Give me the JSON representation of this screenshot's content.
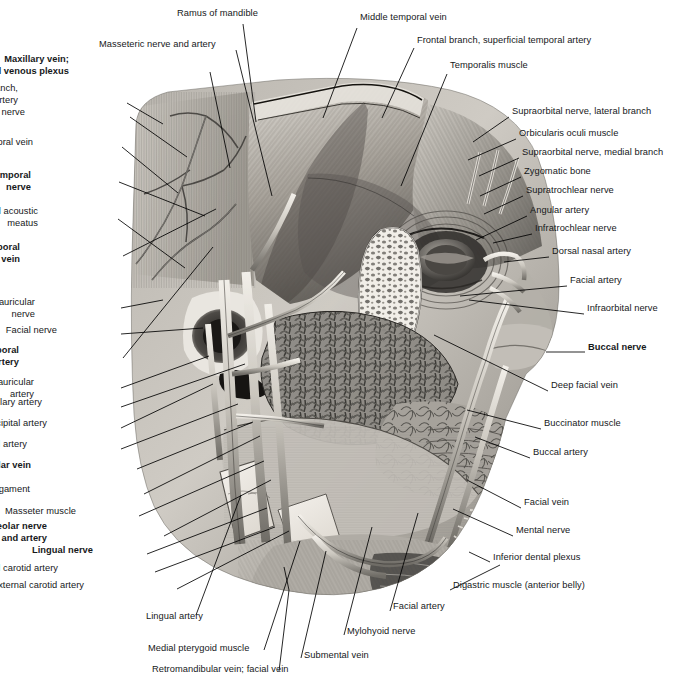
{
  "figure": {
    "kind": "anatomical-illustration",
    "style": "grayscale pencil / airbrush medical drawing",
    "palette": {
      "background": "#ffffff",
      "ink": "#16181a",
      "leader_line": "#000000",
      "tissue_light": "#d8d5d0",
      "tissue_mid": "#9a968f",
      "tissue_dark": "#4e4b47",
      "bone_light": "#efece6",
      "vessel_light": "#e8e5df",
      "shadow": "#2b2926"
    }
  },
  "labels": {
    "top": [
      {
        "id": "ramus-of-mandible",
        "text": "Ramus of mandible",
        "bold": false,
        "align": "left",
        "x": 177,
        "y": 14
      },
      {
        "id": "middle-temporal-vein-top",
        "text": "Middle temporal vein",
        "bold": false,
        "align": "left",
        "x": 360,
        "y": 18
      },
      {
        "id": "masseteric-nerve-and-artery",
        "text": "Masseteric nerve and artery",
        "bold": false,
        "align": "left",
        "x": 99,
        "y": 45
      },
      {
        "id": "frontal-branch-superficial-temporal-artery",
        "text": "Frontal branch, superficial temporal artery",
        "bold": false,
        "align": "left",
        "x": 417,
        "y": 41
      },
      {
        "id": "maxillary-vein-pterygoid-venous-plexus",
        "text": "Maxillary vein;\npterygoid venous plexus",
        "bold": true,
        "align": "right",
        "x": 69,
        "y": 60
      },
      {
        "id": "temporalis-muscle",
        "text": "Temporalis muscle",
        "bold": false,
        "align": "left",
        "x": 450,
        "y": 66
      }
    ],
    "left": [
      {
        "id": "parietal-branch-superficial-temporal-artery",
        "text": "Parietal branch,\nsuperficial temporal artery",
        "bold": false,
        "align": "right",
        "x": 18,
        "y": 89
      },
      {
        "id": "auriculotemporal-nerve-1",
        "text": "Auriculotemporal nerve",
        "bold": false,
        "align": "right",
        "x": 25,
        "y": 113
      },
      {
        "id": "middle-temporal-vein-left",
        "text": "Middle temporal vein",
        "bold": false,
        "align": "right",
        "x": 33,
        "y": 143
      },
      {
        "id": "auriculotemporal-nerve-bold",
        "text": "Auriculotemporal\nnerve",
        "bold": true,
        "align": "right",
        "x": 31,
        "y": 176
      },
      {
        "id": "external-acoustic-meatus",
        "text": "External acoustic\nmeatus",
        "bold": false,
        "align": "right",
        "x": 38,
        "y": 212
      },
      {
        "id": "superficial-temporal-vein",
        "text": "Superficial temporal\nvein",
        "bold": true,
        "align": "right",
        "x": 20,
        "y": 248
      },
      {
        "id": "posterior-auricular-nerve",
        "text": "Posterior auricular\nnerve",
        "bold": false,
        "align": "right",
        "x": 35,
        "y": 303
      },
      {
        "id": "facial-nerve",
        "text": "Facial nerve",
        "bold": false,
        "align": "right",
        "x": 57,
        "y": 331
      },
      {
        "id": "superficial-temporal-artery",
        "text": "Superficial temporal\nartery",
        "bold": true,
        "align": "right",
        "x": 19,
        "y": 351
      },
      {
        "id": "posterior-auricular-artery",
        "text": "Posterior auricular\nartery",
        "bold": false,
        "align": "right",
        "x": 34,
        "y": 383
      },
      {
        "id": "maxillary-artery",
        "text": "Maxillary artery",
        "bold": false,
        "align": "right",
        "x": 42,
        "y": 403
      },
      {
        "id": "occipital-artery",
        "text": "Occipital artery",
        "bold": false,
        "align": "right",
        "x": 47,
        "y": 424
      },
      {
        "id": "external-carotid-artery-upper",
        "text": "External carotid artery",
        "bold": false,
        "align": "right",
        "x": 27,
        "y": 445
      },
      {
        "id": "retromandibular-vein",
        "text": "Retromandibular vein",
        "bold": true,
        "align": "right",
        "x": 31,
        "y": 466
      },
      {
        "id": "sphenomandibular-ligament",
        "text": "Sphenomandibular ligament",
        "bold": false,
        "align": "right",
        "x": 30,
        "y": 490
      },
      {
        "id": "masseter-muscle",
        "text": "Masseter muscle",
        "bold": false,
        "align": "right",
        "x": 76,
        "y": 512
      },
      {
        "id": "inferior-alveolar-nerve-and-artery",
        "text": "Inferior alveolar nerve\nand artery",
        "bold": true,
        "align": "right",
        "x": 47,
        "y": 527
      },
      {
        "id": "lingual-nerve",
        "text": "Lingual nerve",
        "bold": true,
        "align": "right",
        "x": 93,
        "y": 551
      },
      {
        "id": "internal-carotid-artery",
        "text": "Internal carotid artery",
        "bold": false,
        "align": "right",
        "x": 58,
        "y": 569
      },
      {
        "id": "external-carotid-artery-lower",
        "text": "External carotid artery",
        "bold": false,
        "align": "right",
        "x": 84,
        "y": 586
      }
    ],
    "right": [
      {
        "id": "supraorbital-nerve-lateral-branch",
        "text": "Supraorbital nerve, lateral branch",
        "bold": false,
        "align": "left",
        "x": 512,
        "y": 112
      },
      {
        "id": "orbicularis-oculi-muscle",
        "text": "Orbicularis oculi muscle",
        "bold": false,
        "align": "left",
        "x": 519,
        "y": 134
      },
      {
        "id": "supraorbital-nerve-medial-branch",
        "text": "Supraorbital nerve, medial branch",
        "bold": false,
        "align": "left",
        "x": 522,
        "y": 153
      },
      {
        "id": "zygomatic-bone",
        "text": "Zygomatic bone",
        "bold": false,
        "align": "left",
        "x": 524,
        "y": 172
      },
      {
        "id": "supratrochlear-nerve",
        "text": "Supratrochlear nerve",
        "bold": false,
        "align": "left",
        "x": 526,
        "y": 191
      },
      {
        "id": "angular-artery",
        "text": "Angular artery",
        "bold": false,
        "align": "left",
        "x": 530,
        "y": 211
      },
      {
        "id": "infratrochlear-nerve",
        "text": "Infratrochlear nerve",
        "bold": false,
        "align": "left",
        "x": 535,
        "y": 229
      },
      {
        "id": "dorsal-nasal-artery",
        "text": "Dorsal nasal artery",
        "bold": false,
        "align": "left",
        "x": 552,
        "y": 252
      },
      {
        "id": "facial-artery-right",
        "text": "Facial artery",
        "bold": false,
        "align": "left",
        "x": 570,
        "y": 281
      },
      {
        "id": "infraorbital-nerve",
        "text": "Infraorbital nerve",
        "bold": false,
        "align": "left",
        "x": 587,
        "y": 309
      },
      {
        "id": "buccal-nerve",
        "text": "Buccal nerve",
        "bold": true,
        "align": "left",
        "x": 588,
        "y": 348
      },
      {
        "id": "deep-facial-vein",
        "text": "Deep facial vein",
        "bold": false,
        "align": "left",
        "x": 551,
        "y": 386
      },
      {
        "id": "buccinator-muscle",
        "text": "Buccinator muscle",
        "bold": false,
        "align": "left",
        "x": 544,
        "y": 424
      },
      {
        "id": "buccal-artery",
        "text": "Buccal artery",
        "bold": false,
        "align": "left",
        "x": 533,
        "y": 453
      },
      {
        "id": "facial-vein",
        "text": "Facial vein",
        "bold": false,
        "align": "left",
        "x": 524,
        "y": 503
      },
      {
        "id": "mental-nerve",
        "text": "Mental nerve",
        "bold": false,
        "align": "left",
        "x": 516,
        "y": 531
      },
      {
        "id": "inferior-dental-plexus",
        "text": "Inferior dental plexus",
        "bold": false,
        "align": "left",
        "x": 493,
        "y": 558
      },
      {
        "id": "digastric-muscle-anterior-belly",
        "text": "Digastric muscle (anterior belly)",
        "bold": false,
        "align": "left",
        "x": 453,
        "y": 586
      }
    ],
    "bottom": [
      {
        "id": "lingual-artery",
        "text": "Lingual artery",
        "bold": false,
        "align": "left",
        "x": 146,
        "y": 617
      },
      {
        "id": "facial-artery-bottom",
        "text": "Facial artery",
        "bold": false,
        "align": "left",
        "x": 393,
        "y": 607
      },
      {
        "id": "mylohyoid-nerve",
        "text": "Mylohyoid nerve",
        "bold": false,
        "align": "left",
        "x": 347,
        "y": 632
      },
      {
        "id": "medial-pterygoid-muscle",
        "text": "Medial pterygoid muscle",
        "bold": false,
        "align": "left",
        "x": 148,
        "y": 649
      },
      {
        "id": "submental-vein",
        "text": "Submental vein",
        "bold": false,
        "align": "left",
        "x": 304,
        "y": 656
      },
      {
        "id": "retromandibular-vein-facial-vein",
        "text": "Retromandibular vein; facial vein",
        "bold": false,
        "align": "left",
        "x": 152,
        "y": 670
      }
    ]
  },
  "leaders": [
    {
      "id": "ld-ramus-of-mandible",
      "pts": "243,24 256,122"
    },
    {
      "id": "ld-middle-temporal-vein-top",
      "pts": "357,28 323,118"
    },
    {
      "id": "ld-masseteric-nerve-and-artery",
      "pts": "236,50 272,196"
    },
    {
      "id": "ld-frontal-branch",
      "pts": "414,48 382,118"
    },
    {
      "id": "ld-maxillary-vein",
      "pts": "210,72 230,168"
    },
    {
      "id": "ld-temporalis-muscle",
      "pts": "447,74 401,186"
    },
    {
      "id": "ld-parietal-branch",
      "pts": "127,103 163,124"
    },
    {
      "id": "ld-auriculotemporal-nerve-1",
      "pts": "130,117 187,157"
    },
    {
      "id": "ld-middle-temporal-vein-left",
      "pts": "122,147 178,193"
    },
    {
      "id": "ld-auriculotemporal-nerve-bold",
      "pts": "119,182 205,216"
    },
    {
      "id": "ld-external-acoustic-meatus",
      "pts": "118,219 185,268"
    },
    {
      "id": "ld-superficial-temporal-vein",
      "pts": "123,256 216,209"
    },
    {
      "id": "ld-posterior-auricular-nerve",
      "pts": "121,308 163,300"
    },
    {
      "id": "ld-facial-nerve",
      "pts": "121,334 203,328"
    },
    {
      "id": "ld-superficial-temporal-artery",
      "pts": "123,358 213,247"
    },
    {
      "id": "ld-posterior-auricular-artery",
      "pts": "121,388 209,356"
    },
    {
      "id": "ld-maxillary-artery",
      "pts": "121,407 245,364"
    },
    {
      "id": "ld-occipital-artery",
      "pts": "121,428 213,384"
    },
    {
      "id": "ld-external-carotid-artery-upper",
      "pts": "121,449 238,404"
    },
    {
      "id": "ld-retromandibular-vein",
      "pts": "137,469 253,422"
    },
    {
      "id": "ld-sphenomandibular-ligament",
      "pts": "144,494 260,436"
    },
    {
      "id": "ld-masseter-muscle",
      "pts": "139,516 264,461"
    },
    {
      "id": "ld-inferior-alveolar",
      "pts": "164,536 271,480"
    },
    {
      "id": "ld-lingual-nerve",
      "pts": "147,554 267,508"
    },
    {
      "id": "ld-internal-carotid-artery",
      "pts": "155,572 275,527"
    },
    {
      "id": "ld-external-carotid-artery-lower",
      "pts": "177,589 289,531"
    },
    {
      "id": "ld-supraorbital-nerve-lateral",
      "pts": "509,117 473,142"
    },
    {
      "id": "ld-orbicularis-oculi-muscle",
      "pts": "516,139 468,160"
    },
    {
      "id": "ld-supraorbital-nerve-medial",
      "pts": "519,158 479,176"
    },
    {
      "id": "ld-zygomatic-bone",
      "pts": "521,177 480,196"
    },
    {
      "id": "ld-supratrochlear-nerve",
      "pts": "523,196 484,214"
    },
    {
      "id": "ld-angular-artery",
      "pts": "527,216 476,240"
    },
    {
      "id": "ld-infratrochlear-nerve",
      "pts": "532,234 493,243"
    },
    {
      "id": "ld-dorsal-nasal-artery",
      "pts": "549,257 504,262"
    },
    {
      "id": "ld-facial-artery-right",
      "pts": "567,286 460,296"
    },
    {
      "id": "ld-infraorbital-nerve",
      "pts": "584,314 469,300"
    },
    {
      "id": "ld-buccal-nerve",
      "pts": "585,352 546,352"
    },
    {
      "id": "ld-deep-facial-vein",
      "pts": "548,391 434,335"
    },
    {
      "id": "ld-buccinator-muscle",
      "pts": "541,429 467,410"
    },
    {
      "id": "ld-buccal-artery",
      "pts": "530,458 475,437"
    },
    {
      "id": "ld-facial-vein",
      "pts": "521,508 467,480"
    },
    {
      "id": "ld-mental-nerve",
      "pts": "513,536 453,509"
    },
    {
      "id": "ld-inferior-dental-plexus",
      "pts": "490,562 469,552"
    },
    {
      "id": "ld-digastric-muscle",
      "pts": "450,590 500,565"
    },
    {
      "id": "ld-lingual-artery",
      "pts": "196,615 241,495"
    },
    {
      "id": "ld-facial-artery-bottom",
      "pts": "390,611 418,513"
    },
    {
      "id": "ld-mylohyoid-nerve",
      "pts": "344,635 372,527"
    },
    {
      "id": "ld-medial-pterygoid-muscle",
      "pts": "264,650 300,541"
    },
    {
      "id": "ld-submental-vein",
      "pts": "301,658 326,551"
    },
    {
      "id": "ld-retromandibular-facial-vein",
      "pts": "279,671 289,590 284,567"
    }
  ]
}
